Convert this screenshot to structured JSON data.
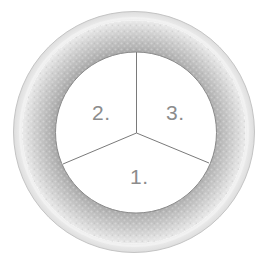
{
  "diagram": {
    "shape": "circle",
    "sectors": [
      {
        "id": 1,
        "label": "1.",
        "position": "bottom"
      },
      {
        "id": 2,
        "label": "2.",
        "position": "upper-left"
      },
      {
        "id": 3,
        "label": "3.",
        "position": "upper-right"
      }
    ],
    "colors": {
      "background": "#ffffff",
      "inner_fill": "#ffffff",
      "ring_outer": "#ececec",
      "ring_inner": "#a9a9a9",
      "divider_lines": "#7a7a7a",
      "label_text": "#8c8c8c",
      "rim_outline": "#bdbdbd"
    }
  }
}
